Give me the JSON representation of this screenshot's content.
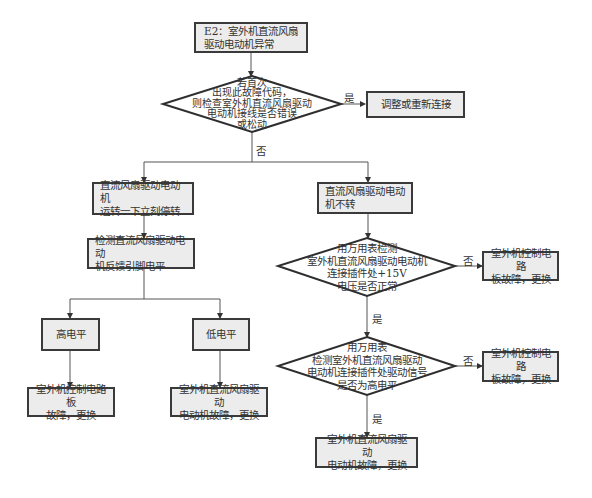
{
  "diagram": {
    "colors": {
      "box_fill": "#ececec",
      "box_border": "#3a3a3a",
      "line": "#555555",
      "text": "#333333"
    },
    "nodes": {
      "start": {
        "text": "E2：室外机直流风扇\n驱动电动机异常"
      },
      "decision1": {
        "text": "若首次\n出现此故障代码，\n则检查室外机直流风扇驱动\n电动机接线是否错误\n或松动"
      },
      "action_reconnect": {
        "text": "调整或重新连接"
      },
      "symptom_stop": {
        "text": "直流风扇驱动电动机\n运转一下立刻停转"
      },
      "symptom_no_spin": {
        "text": "直流风扇驱动电动\n机不转"
      },
      "check_feedback": {
        "text": "检测直流风扇驱动电动\n机反馈引脚电平"
      },
      "high_level": {
        "text": "高电平"
      },
      "low_level": {
        "text": "低电平"
      },
      "result_board_left": {
        "text": "室外机控制电路板\n故障，更换"
      },
      "result_motor_left": {
        "text": "室外机直流风扇驱动\n电动机故障，更换"
      },
      "decision2": {
        "text": "用万用表检测\n室外机直流风扇驱动电动机\n连接插件处+15V\n电压是否正常"
      },
      "result_board_right1": {
        "text": "室外机控制电路\n板故障，更换"
      },
      "decision3": {
        "text": "用万用表\n检测室外机直流风扇驱动\n电动机连接插件处驱动信号\n是否为高电平"
      },
      "result_board_right2": {
        "text": "室外机控制电路\n板故障，更换"
      },
      "result_motor_right": {
        "text": "室外机直流风扇驱动\n电动机故障，更换"
      }
    },
    "edge_labels": {
      "d1_yes": "是",
      "d1_no": "否",
      "d2_no": "否",
      "d2_yes": "是",
      "d3_no": "否",
      "d3_yes": "是"
    }
  }
}
